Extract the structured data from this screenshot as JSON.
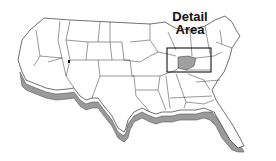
{
  "map": {
    "title_line1": "Detail",
    "title_line2": "Area",
    "highlight_color": "#a0a0a0",
    "land_color": "#ffffff",
    "border_color": "#333333",
    "extrusion_color": "#9a9a9a"
  }
}
